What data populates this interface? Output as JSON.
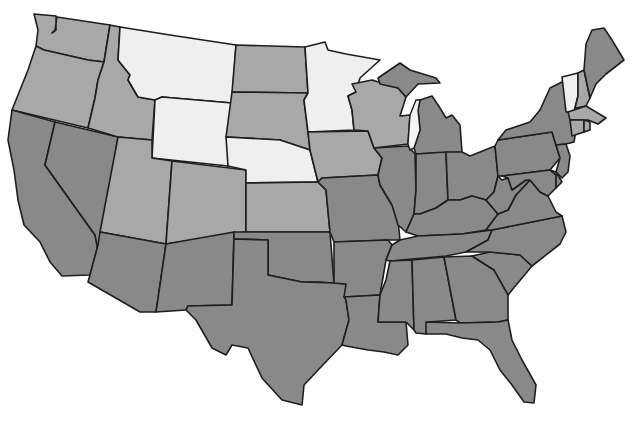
{
  "map": {
    "title": "",
    "region": "Contiguous United States",
    "legend": [],
    "shades": {
      "light": "#efefef",
      "medium": "#a8a8a8",
      "dark": "#898989"
    },
    "border_color": "#1e1e1e",
    "background": "#ffffff",
    "states": [
      {
        "id": "WA",
        "shade": "medium",
        "points": "34,14 56,16 56,30 52,33 55,30 57,17 110,25 104,62 88,60 44,50 36,46 38,30"
      },
      {
        "id": "OR",
        "shade": "medium",
        "points": "36,46 44,50 88,60 104,62 98,80 95,98 88,128 12,110 20,90 28,70"
      },
      {
        "id": "CA",
        "shade": "dark",
        "points": "12,110 55,122 45,165 95,235 98,245 90,275 62,276 50,262 40,242 24,225 18,200 14,170 8,140"
      },
      {
        "id": "NV",
        "shade": "dark",
        "points": "55,122 118,137 100,262 95,235 45,165"
      },
      {
        "id": "ID",
        "shade": "medium",
        "points": "110,25 120,27 118,60 130,75 128,80 138,97 155,100 152,140 118,137 88,128 95,98 98,80 104,62"
      },
      {
        "id": "MT",
        "shade": "light",
        "points": "120,27 170,35 236,45 232,103 162,97 155,100 138,97 128,80 130,75 118,60"
      },
      {
        "id": "WY",
        "shade": "light",
        "points": "162,97 232,103 228,166 152,158 155,100"
      },
      {
        "id": "UT",
        "shade": "medium",
        "points": "118,137 152,140 152,158 172,161 166,244 100,232"
      },
      {
        "id": "CO",
        "shade": "medium",
        "points": "172,161 246,170 246,232 166,244"
      },
      {
        "id": "AZ",
        "shade": "dark",
        "points": "100,232 166,244 156,312 140,312 88,282 90,275 98,245"
      },
      {
        "id": "NM",
        "shade": "dark",
        "points": "166,244 234,232 232,305 188,306 186,310 156,312"
      },
      {
        "id": "ND",
        "shade": "medium",
        "points": "236,45 305,47 308,93 232,92"
      },
      {
        "id": "SD",
        "shade": "medium",
        "points": "232,92 308,93 304,100 308,132 310,150 280,140 226,137"
      },
      {
        "id": "NE",
        "shade": "light",
        "points": "226,137 280,140 310,150 318,182 246,183 246,170 228,166"
      },
      {
        "id": "KS",
        "shade": "medium",
        "points": "246,183 318,182 326,190 330,232 246,232"
      },
      {
        "id": "OK",
        "shade": "dark",
        "points": "234,232 330,232 334,283 320,282 302,282 268,275 268,240 234,239"
      },
      {
        "id": "TX",
        "shade": "dark",
        "points": "234,239 268,240 268,275 302,282 334,283 346,284 346,300 349,320 342,345 320,368 304,385 302,405 282,400 262,378 248,348 232,345 226,355 212,348 196,320 186,310 188,306 232,305"
      },
      {
        "id": "MN",
        "shade": "light",
        "points": "305,47 325,42 328,50 346,54 380,60 360,78 356,92 348,96 352,110 354,130 308,132 304,100 308,93"
      },
      {
        "id": "IA",
        "shade": "medium",
        "points": "308,132 368,131 374,148 382,158 378,175 322,178 318,182 310,150"
      },
      {
        "id": "MO",
        "shade": "dark",
        "points": "318,182 322,178 378,175 380,185 392,205 398,220 400,240 388,240 334,242 330,232 326,190"
      },
      {
        "id": "AR",
        "shade": "dark",
        "points": "334,242 388,240 392,245 386,260 380,295 344,297 346,284 334,283"
      },
      {
        "id": "LA",
        "shade": "dark",
        "points": "344,297 380,295 378,322 406,322 408,345 398,355 384,352 368,350 346,346 342,345 349,320 346,300"
      },
      {
        "id": "WI",
        "shade": "medium",
        "points": "352,84 372,80 398,88 406,97 400,116 410,115 408,144 374,148 368,131 354,130 352,110 348,96 356,92"
      },
      {
        "id": "IL",
        "shade": "dark",
        "points": "374,148 408,146 415,154 416,190 414,214 406,232 398,225 392,205 380,185 378,175 382,158"
      },
      {
        "id": "MI",
        "shade": "dark",
        "points": "378,78 400,63 410,70 436,78 440,83 418,84 406,97 398,88 380,84"
      },
      {
        "id": "MI-LP",
        "shade": "dark",
        "points": "420,100 432,96 440,108 446,118 452,115 460,125 462,152 416,154 414,148 420,130 418,110"
      },
      {
        "id": "IN",
        "shade": "dark",
        "points": "416,154 446,152 448,200 436,208 420,214 414,214 416,190"
      },
      {
        "id": "OH",
        "shade": "dark",
        "points": "446,152 462,152 470,156 495,146 498,176 494,192 486,200 472,196 460,200 448,200"
      },
      {
        "id": "KY",
        "shade": "dark",
        "points": "406,232 414,214 420,214 436,208 448,200 460,200 472,196 486,200 498,214 486,230 462,234 418,236"
      },
      {
        "id": "TN",
        "shade": "dark",
        "points": "392,245 400,240 418,236 462,234 492,230 488,240 466,252 446,256 390,261 386,260"
      },
      {
        "id": "MS",
        "shade": "dark",
        "points": "390,261 412,260 414,330 406,322 378,322 380,295 386,280"
      },
      {
        "id": "AL",
        "shade": "dark",
        "points": "412,260 444,257 456,320 428,322 426,334 416,333 414,330"
      },
      {
        "id": "GA",
        "shade": "dark",
        "points": "444,257 472,256 494,270 508,290 508,320 498,322 460,323 456,320"
      },
      {
        "id": "FL",
        "shade": "dark",
        "points": "426,322 460,323 498,322 508,320 512,340 522,360 536,385 534,403 524,402 512,385 500,370 490,350 478,340 462,338 446,334 426,334"
      },
      {
        "id": "SC",
        "shade": "dark",
        "points": "472,256 490,252 520,255 532,266 512,290 508,295 494,270"
      },
      {
        "id": "NC",
        "shade": "dark",
        "points": "466,252 488,240 492,230 562,216 566,232 560,244 532,266 520,255 490,252"
      },
      {
        "id": "VA",
        "shade": "dark",
        "points": "486,230 498,214 508,210 516,195 530,180 540,192 548,196 556,212 562,216 492,230"
      },
      {
        "id": "WV",
        "shade": "dark",
        "points": "486,200 494,192 498,176 502,180 508,178 512,190 526,180 530,180 516,195 508,210 498,214"
      },
      {
        "id": "PA",
        "shade": "dark",
        "points": "495,146 498,140 552,132 556,145 560,158 550,170 502,176 498,176"
      },
      {
        "id": "NY",
        "shade": "dark",
        "points": "498,140 506,130 530,122 540,110 550,88 566,80 572,80 572,114 576,130 574,142 566,144 556,145 552,132"
      },
      {
        "id": "NJ",
        "shade": "dark",
        "points": "556,145 566,144 570,156 568,172 562,178 556,172 560,158"
      },
      {
        "id": "MD",
        "shade": "dark",
        "points": "502,176 550,170 556,175 556,188 548,196 540,192 530,180 526,180 512,190 508,178"
      },
      {
        "id": "DE",
        "shade": "dark",
        "points": "550,170 556,172 562,182 556,188 556,175"
      },
      {
        "id": "VT",
        "shade": "light",
        "points": "562,77 578,73 578,96 574,112 566,112"
      },
      {
        "id": "NH",
        "shade": "medium",
        "points": "578,73 584,70 590,98 586,106 576,108 574,112 578,96"
      },
      {
        "id": "ME",
        "shade": "dark",
        "points": "584,70 586,44 592,30 604,28 612,40 624,60 606,74 596,84 590,98"
      },
      {
        "id": "MA",
        "shade": "medium",
        "points": "568,112 586,106 596,112 606,118 598,124 588,120 570,120"
      },
      {
        "id": "CT",
        "shade": "medium",
        "points": "570,120 584,120 584,132 572,136"
      },
      {
        "id": "RI",
        "shade": "medium",
        "points": "584,120 590,122 590,130 584,132"
      }
    ],
    "lakes": [
      {
        "id": "lake-michigan",
        "points": "410,115 416,100 420,100 418,110 420,130 414,148 410,150 408,144"
      }
    ]
  }
}
